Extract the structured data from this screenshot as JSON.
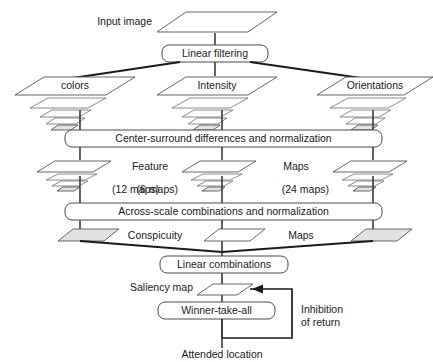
{
  "diagram": {
    "type": "flowchart",
    "nodes": {
      "input_image": "Input image",
      "linear_filtering": "Linear filtering",
      "colors": "colors",
      "intensity": "Intensity",
      "orientations": "Orientations",
      "center_surround": "Center-surround differences and normalization",
      "feature": "Feature",
      "maps_top": "Maps",
      "maps_12": "(12 maps)",
      "maps_6": "(6 maps)",
      "maps_24": "(24 maps)",
      "across_scale": "Across-scale combinations and normalization",
      "conspicuity": "Conspicuity",
      "maps_bottom": "Maps",
      "linear_combinations": "Linear combinations",
      "saliency_map": "Saliency map",
      "winner_take_all": "Winner-take-all",
      "inhibition_line1": "Inhibition",
      "inhibition_line2": "of return",
      "attended_location": "Attended location"
    },
    "colors": {
      "background": "#ffffff",
      "text": "#1a1a1a",
      "plate_stroke": "#555555",
      "plate_fill": "#ffffff",
      "plate_shaded_fill": "#e2e2e2",
      "box_stroke": "#4a4a4a",
      "connector": "#3a3a3a",
      "connector_thick": "#1a1a1a"
    }
  }
}
